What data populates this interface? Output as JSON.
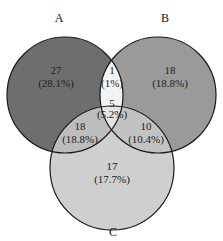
{
  "diagram": {
    "type": "venn-3",
    "sets": [
      {
        "id": "A",
        "label": "A",
        "color": "#6e6e6e"
      },
      {
        "id": "B",
        "label": "B",
        "color": "#9a9a9a"
      },
      {
        "id": "C",
        "label": "C",
        "color": "#cfcfcf"
      }
    ],
    "regions": {
      "a_only": {
        "count": "27",
        "percent": "(28.1%)"
      },
      "b_only": {
        "count": "18",
        "percent": "(18.8%)"
      },
      "c_only": {
        "count": "17",
        "percent": "(17.7%)"
      },
      "ab_only": {
        "count": "1",
        "percent": "(1%)"
      },
      "ac_only": {
        "count": "18",
        "percent": "(18.8%)"
      },
      "bc_only": {
        "count": "10",
        "percent": "(10.4%)"
      },
      "abc": {
        "count": "5",
        "percent": "(5.2%)"
      }
    },
    "colors": {
      "ab_only": "#f4f4f4",
      "ac_only": "#bdbdbd",
      "bc_only": "#c2c2c2",
      "abc": "#e4e4e4",
      "outline": "#1a1a1a"
    }
  }
}
